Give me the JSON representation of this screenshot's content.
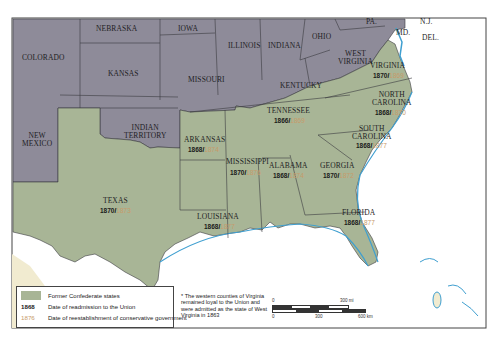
{
  "map": {
    "title": "Reconstruction in the South",
    "colors": {
      "confederate": "#a8b596",
      "union": "#8e8b99",
      "water": "#ffffff",
      "coast": "#3f9fd0",
      "mexico": "#f1ebd0",
      "border": "#3a3a40",
      "readmission_text": "#1a1a1a",
      "conservative_text": "#c79a6a"
    },
    "non_confederate_states": [
      {
        "name": "COLORADO"
      },
      {
        "name": "NEBRASKA"
      },
      {
        "name": "IOWA"
      },
      {
        "name": "ILLINOIS"
      },
      {
        "name": "INDIANA"
      },
      {
        "name": "OHIO"
      },
      {
        "name": "PA."
      },
      {
        "name": "N.J."
      },
      {
        "name": "MD."
      },
      {
        "name": "DEL."
      },
      {
        "name": "WEST VIRGINIA",
        "line1": "WEST",
        "line2": "VIRGINIA"
      },
      {
        "name": "KANSAS"
      },
      {
        "name": "MISSOURI"
      },
      {
        "name": "KENTUCKY"
      },
      {
        "name": "NEW MEXICO",
        "line1": "NEW",
        "line2": "MEXICO"
      },
      {
        "name": "INDIAN TERRITORY",
        "line1": "INDIAN",
        "line2": "TERRITORY"
      }
    ],
    "confederate_states": [
      {
        "name": "VIRGINIA",
        "readmission": "1870",
        "conservative": "1869"
      },
      {
        "name": "NORTH CAROLINA",
        "line1": "NORTH",
        "line2": "CAROLINA",
        "readmission": "1868",
        "conservative": "1870"
      },
      {
        "name": "TENNESSEE",
        "readmission": "1866",
        "conservative": "1869"
      },
      {
        "name": "SOUTH CAROLINA",
        "line1": "SOUTH",
        "line2": "CAROLINA",
        "readmission": "1868",
        "conservative": "1877"
      },
      {
        "name": "ARKANSAS",
        "readmission": "1868",
        "conservative": "1874"
      },
      {
        "name": "MISSISSIPPI",
        "readmission": "1870",
        "conservative": "1876"
      },
      {
        "name": "ALABAMA",
        "readmission": "1868",
        "conservative": "1874"
      },
      {
        "name": "GEORGIA",
        "readmission": "1870",
        "conservative": "1872"
      },
      {
        "name": "TEXAS",
        "readmission": "1870",
        "conservative": "1873"
      },
      {
        "name": "LOUISIANA",
        "readmission": "1868",
        "conservative": "1877"
      },
      {
        "name": "FLORIDA",
        "readmission": "1868",
        "conservative": "1877"
      }
    ]
  },
  "legend": {
    "items": [
      {
        "key": "",
        "label": "Former Confederate states"
      },
      {
        "key": "1868",
        "label": "Date of readmission to the Union"
      },
      {
        "key": "1876",
        "label": "Date of reestablishment of conservative government"
      }
    ]
  },
  "footnote": "* The western counties of Virginia remained loyal to the Union and were admitted as the state of West Virginia in 1863",
  "scale": {
    "mi_start": "0",
    "mi_end": "300 mi",
    "km_start": "0",
    "km_mid": "300",
    "km_end": "600 km"
  }
}
